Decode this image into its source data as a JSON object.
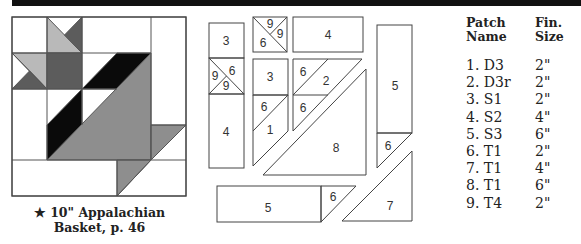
{
  "header": {
    "bar_color": "#111111"
  },
  "block": {
    "caption_line1": "★ 10\" Appalachian",
    "caption_line2": "Basket, p. 46",
    "colors": {
      "light": "#b9b9b9",
      "dark": "#5c5c5c",
      "black": "#0a0a0a",
      "medium": "#8e8e8e",
      "outline": "#555555"
    }
  },
  "pieces": {
    "labels": [
      {
        "text": "3",
        "x": 226,
        "y": 45
      },
      {
        "text": "9",
        "x": 215,
        "y": 80
      },
      {
        "text": "6",
        "x": 232,
        "y": 75
      },
      {
        "text": "9",
        "x": 226,
        "y": 90
      },
      {
        "text": "4",
        "x": 226,
        "y": 136
      },
      {
        "text": "9",
        "x": 270,
        "y": 28
      },
      {
        "text": "9",
        "x": 280,
        "y": 38
      },
      {
        "text": "6",
        "x": 263,
        "y": 47
      },
      {
        "text": "4",
        "x": 328,
        "y": 39
      },
      {
        "text": "3",
        "x": 270,
        "y": 81
      },
      {
        "text": "6",
        "x": 264,
        "y": 111
      },
      {
        "text": "1",
        "x": 270,
        "y": 134
      },
      {
        "text": "6",
        "x": 303,
        "y": 76
      },
      {
        "text": "2",
        "x": 326,
        "y": 85
      },
      {
        "text": "6",
        "x": 303,
        "y": 112
      },
      {
        "text": "8",
        "x": 336,
        "y": 152
      },
      {
        "text": "5",
        "x": 395,
        "y": 90
      },
      {
        "text": "6",
        "x": 388,
        "y": 150
      },
      {
        "text": "7",
        "x": 390,
        "y": 210
      },
      {
        "text": "5",
        "x": 268,
        "y": 212
      },
      {
        "text": "6",
        "x": 333,
        "y": 201
      }
    ]
  },
  "table": {
    "headers": [
      [
        "Patch",
        "Name"
      ],
      [
        "Fin.",
        "Size"
      ]
    ],
    "rows": [
      {
        "name": "1. D3",
        "size": "2\""
      },
      {
        "name": "2. D3r",
        "size": "2\""
      },
      {
        "name": "3. S1",
        "size": "2\""
      },
      {
        "name": "4. S2",
        "size": "4\""
      },
      {
        "name": "5. S3",
        "size": "6\""
      },
      {
        "name": "6. T1",
        "size": "2\""
      },
      {
        "name": "7. T1",
        "size": "4\""
      },
      {
        "name": "8. T1",
        "size": "6\""
      },
      {
        "name": "9. T4",
        "size": "2\""
      }
    ]
  }
}
